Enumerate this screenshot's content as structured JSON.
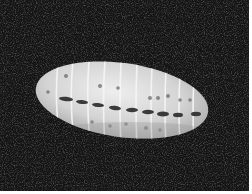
{
  "image": {
    "subject": "segmented insect larva (pupa) on dark textured background",
    "colors": {
      "background": "#141414",
      "background_texture": "#3a3a3a",
      "body_light": "#e6e6e6",
      "body_mid": "#bdbdbd",
      "segment_lines": "#f4f4f4",
      "spots": "#3c3c3c",
      "border": "#ffffff"
    },
    "segments": 10
  }
}
